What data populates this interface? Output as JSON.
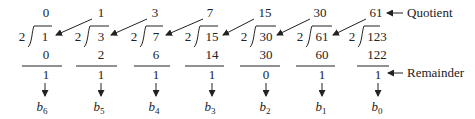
{
  "divisor": "2",
  "steps": [
    {
      "quotient": "0",
      "dividend": "1",
      "product": "0",
      "remainder": "1",
      "bit": "b",
      "bit_sub": "6"
    },
    {
      "quotient": "1",
      "dividend": "3",
      "product": "2",
      "remainder": "1",
      "bit": "b",
      "bit_sub": "5"
    },
    {
      "quotient": "3",
      "dividend": "7",
      "product": "6",
      "remainder": "1",
      "bit": "b",
      "bit_sub": "4"
    },
    {
      "quotient": "7",
      "dividend": "15",
      "product": "14",
      "remainder": "1",
      "bit": "b",
      "bit_sub": "3"
    },
    {
      "quotient": "15",
      "dividend": "30",
      "product": "30",
      "remainder": "0",
      "bit": "b",
      "bit_sub": "2"
    },
    {
      "quotient": "30",
      "dividend": "61",
      "product": "60",
      "remainder": "1",
      "bit": "b",
      "bit_sub": "1"
    },
    {
      "quotient": "61",
      "dividend": "123",
      "product": "122",
      "remainder": "1",
      "bit": "b",
      "bit_sub": "0"
    }
  ],
  "labels": {
    "quotient": "Quotient",
    "remainder": "Remainder"
  },
  "colors": {
    "ink": "#222222",
    "background": "#ffffff"
  }
}
